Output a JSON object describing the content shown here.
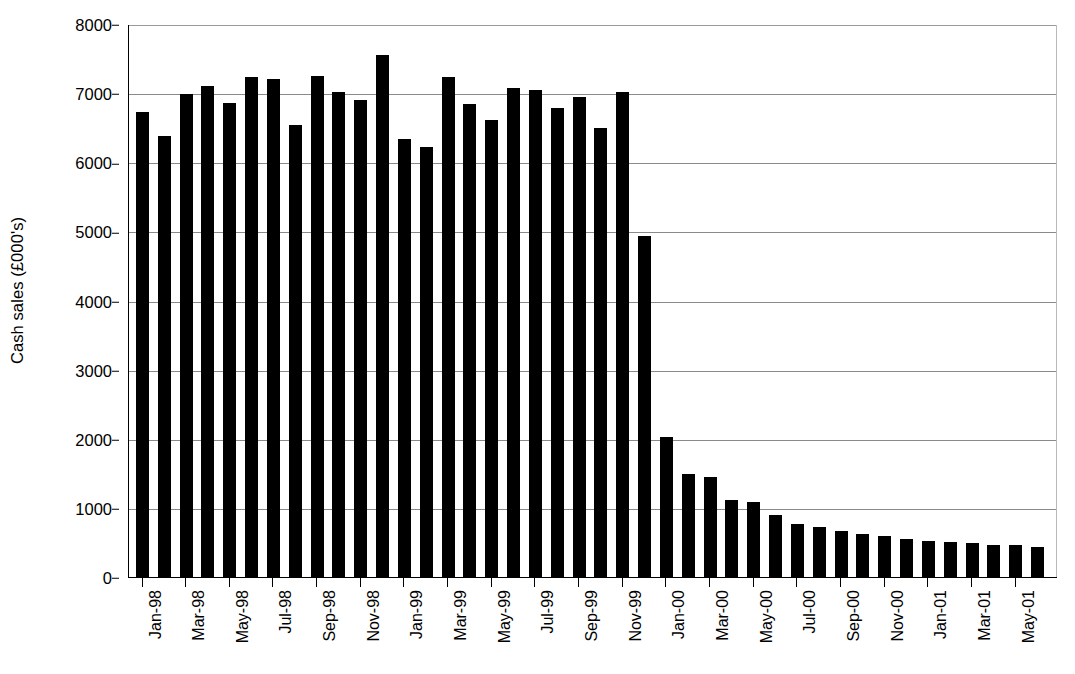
{
  "chart_data": {
    "type": "bar",
    "title": "",
    "xlabel": "",
    "ylabel": "Cash sales (£000's)",
    "ylim": [
      0,
      8000
    ],
    "ytick_values": [
      0,
      1000,
      2000,
      3000,
      4000,
      5000,
      6000,
      7000,
      8000
    ],
    "ytick_labels": [
      "0",
      "1000",
      "2000",
      "3000",
      "4000",
      "5000",
      "6000",
      "7000",
      "8000"
    ],
    "grid": true,
    "legend": "none",
    "bar_color": "#000000",
    "grid_color": "#8a8a8a",
    "axis_color": "#000000",
    "categories": [
      "Jan-98",
      "Feb-98",
      "Mar-98",
      "Apr-98",
      "May-98",
      "Jun-98",
      "Jul-98",
      "Aug-98",
      "Sep-98",
      "Oct-98",
      "Nov-98",
      "Dec-98",
      "Jan-99",
      "Feb-99",
      "Mar-99",
      "Apr-99",
      "May-99",
      "Jun-99",
      "Jul-99",
      "Aug-99",
      "Sep-99",
      "Oct-99",
      "Nov-99",
      "Dec-99",
      "Jan-00",
      "Feb-00",
      "Mar-00",
      "Apr-00",
      "May-00",
      "Jun-00",
      "Jul-00",
      "Aug-00",
      "Sep-00",
      "Oct-00",
      "Nov-00",
      "Dec-00",
      "Jan-01",
      "Feb-01",
      "Mar-01",
      "Apr-01",
      "May-01",
      "Jun-01"
    ],
    "values": [
      6720,
      6380,
      6990,
      7110,
      6860,
      7230,
      7210,
      6540,
      7250,
      7010,
      6900,
      7550,
      6340,
      6220,
      7230,
      6850,
      6610,
      7080,
      7040,
      6780,
      6940,
      6490,
      7020,
      4940,
      2030,
      1490,
      1440,
      1110,
      1080,
      890,
      770,
      730,
      660,
      620,
      590,
      550,
      520,
      510,
      490,
      470,
      460,
      440
    ],
    "xtick_labels": [
      "Jan-98",
      "Mar-98",
      "May-98",
      "Jul-98",
      "Sep-98",
      "Nov-98",
      "Jan-99",
      "Mar-99",
      "May-99",
      "Jul-99",
      "Sep-99",
      "Nov-99",
      "Jan-00",
      "Mar-00",
      "May-00",
      "Jul-00",
      "Sep-00",
      "Nov-00",
      "Jan-01",
      "Mar-01",
      "May-01"
    ],
    "xtick_indices": [
      0,
      2,
      4,
      6,
      8,
      10,
      12,
      14,
      16,
      18,
      20,
      22,
      24,
      26,
      28,
      30,
      32,
      34,
      36,
      38,
      40
    ]
  },
  "caption": {
    "partial_text": ""
  }
}
